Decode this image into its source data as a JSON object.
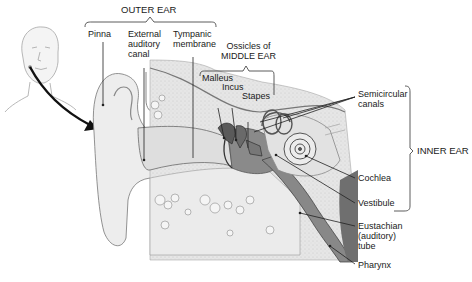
{
  "diagram": {
    "groups": {
      "outer_ear": "OUTER EAR",
      "ossicles": "Ossicles of\nMIDDLE EAR",
      "inner_ear": "INNER EAR"
    },
    "labels": {
      "pinna": "Pinna",
      "external_canal": "External\nauditory\ncanal",
      "tympanic": "Tympanic\nmembrane",
      "malleus": "Malleus",
      "incus": "Incus",
      "stapes": "Stapes",
      "semicircular": "Semicircular\ncanals",
      "cochlea": "Cochlea",
      "vestibule": "Vestibule",
      "eustachian": "Eustachian\n(auditory)\ntube",
      "pharynx": "Pharynx"
    },
    "colors": {
      "ink": "#1a1a1a",
      "skin": "#ececec",
      "bone": "#dcdcdc",
      "tissue": "#c9c9c9",
      "dark": "#7a7a7a"
    }
  }
}
